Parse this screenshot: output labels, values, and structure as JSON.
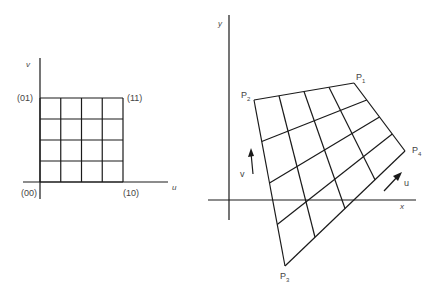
{
  "left_diagram": {
    "title": "unit parameter square",
    "axis_labels": {
      "vertical": "v",
      "horizontal": "u"
    },
    "corner_labels": {
      "origin": "(00)",
      "top_left": "(01)",
      "top_right": "(11)",
      "bottom_right": "(10)"
    },
    "grid_divisions": 4
  },
  "right_diagram": {
    "title": "mapped quadrilateral patch",
    "axis_labels": {
      "vertical": "y",
      "horizontal": "x"
    },
    "points": [
      {
        "name": "P",
        "sub": "1"
      },
      {
        "name": "P",
        "sub": "2"
      },
      {
        "name": "P",
        "sub": "3"
      },
      {
        "name": "P",
        "sub": "4"
      }
    ],
    "direction_labels": {
      "u": "u",
      "v": "v"
    },
    "grid_divisions": 4
  }
}
